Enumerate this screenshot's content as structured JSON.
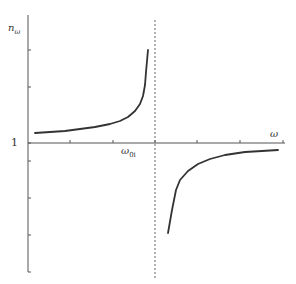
{
  "chart_data": {
    "type": "line",
    "title": "",
    "xlabel": "ω",
    "ylabel": "n_ω",
    "y_reference_label": "1",
    "resonance_label": "ω_0i",
    "grid": false,
    "legend": null,
    "axes": {
      "y_axis": {
        "x_px": 28,
        "top_px": 15,
        "bottom_px": 272,
        "ticks_px": [
          50,
          87,
          143,
          161,
          198,
          235,
          272
        ]
      },
      "x_axis": {
        "y_px": 143,
        "left_px": 28,
        "right_px": 285,
        "ticks_px": [
          70,
          113,
          155,
          197,
          240,
          283
        ]
      }
    },
    "asymptote": {
      "x_px": 155,
      "top_px": 20,
      "bottom_px": 280,
      "style": "dashed"
    },
    "series": [
      {
        "name": "below resonance",
        "points_px": [
          [
            35,
            133
          ],
          [
            50,
            132
          ],
          [
            65,
            131
          ],
          [
            80,
            129
          ],
          [
            95,
            127
          ],
          [
            110,
            124
          ],
          [
            120,
            121
          ],
          [
            128,
            117
          ],
          [
            135,
            111
          ],
          [
            140,
            104
          ],
          [
            143,
            96
          ],
          [
            145,
            85
          ],
          [
            146,
            72
          ],
          [
            148,
            50
          ]
        ]
      },
      {
        "name": "above resonance",
        "points_px": [
          [
            168,
            233
          ],
          [
            172,
            210
          ],
          [
            176,
            190
          ],
          [
            180,
            180
          ],
          [
            188,
            171
          ],
          [
            198,
            164
          ],
          [
            210,
            159
          ],
          [
            225,
            155
          ],
          [
            245,
            152
          ],
          [
            262,
            151
          ],
          [
            278,
            150
          ]
        ]
      }
    ]
  },
  "labels": {
    "ylabel_main": "n",
    "ylabel_sub": "ω",
    "one": "1",
    "xlabel": "ω",
    "w0_main": "ω",
    "w0_sub": "0i"
  },
  "colors": {
    "axis": "#555555",
    "curve": "#333333",
    "asymptote": "#666666"
  }
}
